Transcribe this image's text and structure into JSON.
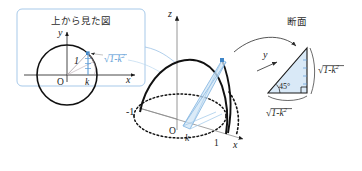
{
  "figure": {
    "domain_kind": "math-geometry-diagram",
    "background_color": "#ffffff",
    "ink_color": "#1a1a1a",
    "accent_color": "#5b9bd5",
    "fill_color": "#cfe4f5"
  },
  "inset": {
    "title": "上から見た図",
    "border_color": "#9dc3e6",
    "axis_y": "y",
    "axis_x": "x",
    "origin": "O",
    "point_k": "k",
    "radius_label": "1",
    "chord_label": "√1-k²",
    "chord_label_parts": {
      "radical": "√",
      "inner": "1-k",
      "exp": "2"
    }
  },
  "main": {
    "axis_z": "z",
    "axis_x": "x",
    "origin": "O",
    "tick_minus_one": "-1",
    "tick_k": "k",
    "tick_one": "1"
  },
  "cross_section": {
    "title": "断面",
    "axis_y": "y",
    "angle_label": "45°",
    "side_right": "√1-k²",
    "side_bottom": "√1-k²",
    "side_parts": {
      "radical": "√",
      "inner": "1-k",
      "exp": "2"
    }
  }
}
